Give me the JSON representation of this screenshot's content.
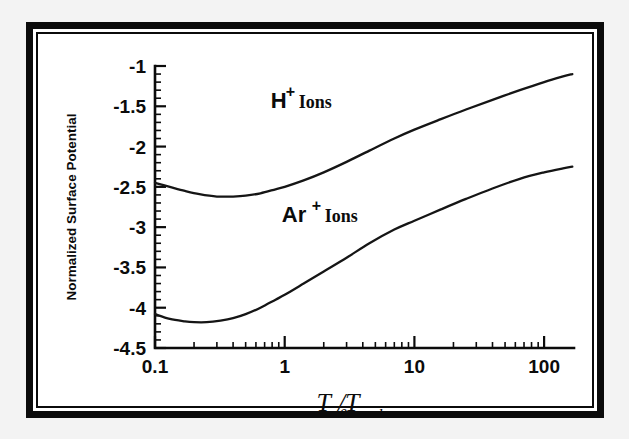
{
  "figure": {
    "background_color": "#ffffff",
    "frame_color": "#0b0b0b",
    "curve_color": "#151515"
  },
  "chart_data": {
    "type": "line",
    "title": "",
    "xlabel": "Te/Ti",
    "xlabel_base": "T",
    "xlabel_sub1": "e",
    "xlabel_slash": "/T",
    "xlabel_sub2": "i",
    "ylabel": "Normalized Surface Potential",
    "xscale": "log",
    "yscale": "linear",
    "xlim": [
      0.1,
      170
    ],
    "ylim": [
      -4.5,
      -1.0
    ],
    "grid": false,
    "legend_position": "inline-annotation",
    "x_tick_labels": [
      "0.1",
      "1",
      "10",
      "100"
    ],
    "x_tick_values": [
      0.1,
      1,
      10,
      100
    ],
    "y_tick_labels": [
      "-1",
      "-1.5",
      "-2",
      "-2.5",
      "-3",
      "-3.5",
      "-4",
      "-4.5"
    ],
    "y_tick_values": [
      -1,
      -1.5,
      -2,
      -2.5,
      -3,
      -3.5,
      -4,
      -4.5
    ],
    "annotations": [
      {
        "id": "h-ions",
        "symbol": "H",
        "charge": "+",
        "word": "Ions",
        "x": 0.78,
        "y": -1.52
      },
      {
        "id": "ar-ions",
        "symbol": "Ar",
        "charge": "+",
        "word": "Ions",
        "x": 0.95,
        "y": -2.93
      }
    ],
    "series": [
      {
        "name": "H+ Ions",
        "x": [
          0.1,
          0.13,
          0.17,
          0.22,
          0.3,
          0.4,
          0.5,
          0.65,
          0.85,
          1.0,
          1.4,
          2.0,
          3.0,
          4.5,
          7.0,
          10.0,
          16.0,
          25.0,
          40.0,
          65.0,
          100.0,
          140.0,
          165.0
        ],
        "y": [
          -2.45,
          -2.5,
          -2.55,
          -2.59,
          -2.62,
          -2.62,
          -2.61,
          -2.58,
          -2.53,
          -2.5,
          -2.42,
          -2.32,
          -2.19,
          -2.05,
          -1.9,
          -1.79,
          -1.66,
          -1.54,
          -1.42,
          -1.3,
          -1.2,
          -1.13,
          -1.1
        ]
      },
      {
        "name": "Ar+ Ions",
        "x": [
          0.1,
          0.13,
          0.17,
          0.2,
          0.25,
          0.32,
          0.4,
          0.5,
          0.65,
          0.85,
          1.0,
          1.4,
          2.0,
          3.0,
          4.5,
          7.0,
          10.0,
          16.0,
          25.0,
          40.0,
          65.0,
          100.0,
          140.0,
          165.0
        ],
        "y": [
          -4.08,
          -4.14,
          -4.17,
          -4.18,
          -4.18,
          -4.16,
          -4.13,
          -4.08,
          -4.0,
          -3.9,
          -3.84,
          -3.7,
          -3.55,
          -3.38,
          -3.2,
          -3.03,
          -2.92,
          -2.78,
          -2.65,
          -2.52,
          -2.4,
          -2.32,
          -2.27,
          -2.25
        ]
      }
    ]
  }
}
